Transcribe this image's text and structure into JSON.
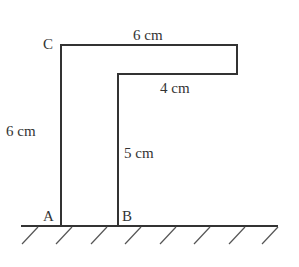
{
  "diagram": {
    "type": "geometry-figure",
    "points": {
      "A": "A",
      "B": "B",
      "C": "C"
    },
    "dimensions": {
      "top_width": "6 cm",
      "left_height": "6 cm",
      "inner_width": "4 cm",
      "inner_height": "5 cm"
    },
    "colors": {
      "stroke": "#333333",
      "background": "#ffffff"
    }
  }
}
